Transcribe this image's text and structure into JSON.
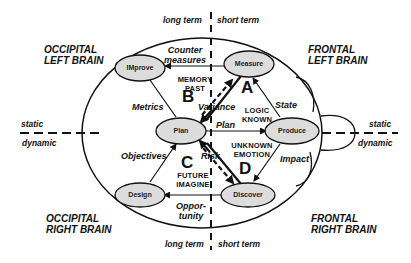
{
  "diagram": {
    "axes": {
      "top_left": "long term",
      "top_right": "short term",
      "bottom_left": "long term",
      "bottom_right": "short term",
      "left_upper": "static",
      "left_lower": "dynamic",
      "right_upper": "static",
      "right_lower": "dynamic"
    },
    "regions": {
      "top_left": [
        "OCCIPITAL",
        "LEFT BRAIN"
      ],
      "top_right": [
        "FRONTAL",
        "LEFT BRAIN"
      ],
      "bottom_left": [
        "OCCIPITAL",
        "RIGHT BRAIN"
      ],
      "bottom_right": [
        "FRONTAL",
        "RIGHT BRAIN"
      ]
    },
    "nodes": {
      "improve": "IMprove",
      "measure": "Measure",
      "plan": "Plan",
      "produce": "Produce",
      "design": "Design",
      "discover": "Discover"
    },
    "quadrants": {
      "a": "A",
      "b": "B",
      "c": "C",
      "d": "D"
    },
    "quadrant_labels": {
      "b": [
        "MEMORY",
        "PAST"
      ],
      "a": [
        "LOGIC",
        "KNOWN"
      ],
      "d": [
        "UNKNOWN",
        "EMOTION"
      ],
      "c": [
        "FUTURE",
        "IMAGINE"
      ]
    },
    "edges": {
      "countermeasures": [
        "Counter",
        "measures"
      ],
      "metrics": "Metrics",
      "variance": "Variance",
      "plan": "Plan",
      "state": "State",
      "objectives": "Objectives",
      "risk": "Risk",
      "impact": "Impact",
      "opportunity": [
        "Oppor-",
        "tunity"
      ]
    },
    "colors": {
      "node_fill": "#dcdcdc",
      "stroke": "#111111",
      "background": "#ffffff"
    }
  }
}
